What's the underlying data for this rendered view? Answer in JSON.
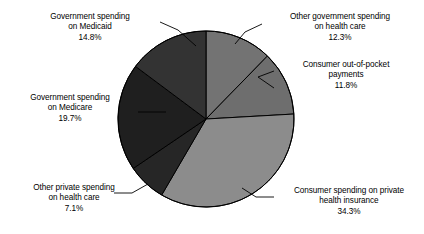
{
  "chart_data": {
    "type": "pie",
    "title": "",
    "subtitle": "",
    "xlabel": "",
    "ylabel": "",
    "legend_position": "none",
    "grid": false,
    "units": "percent",
    "start_angle_deg": 0,
    "direction": "clockwise",
    "center": {
      "x": 206,
      "y": 119
    },
    "radius": 88,
    "categories": [
      "Other government spending on health care",
      "Consumer out-of-pocket payments",
      "Consumer spending on private health insurance",
      "Other private spending on health care",
      "Government spending on Medicare",
      "Government spending on Medicaid"
    ],
    "values": [
      12.3,
      11.8,
      34.3,
      7.1,
      19.7,
      14.8
    ],
    "slices": [
      {
        "id": "other-government-spending",
        "line1": "Other government spending",
        "line2": "on health care",
        "value_label": "12.3%",
        "value": 12.3,
        "color": "#737373",
        "start_deg": 0,
        "end_deg": 44.28
      },
      {
        "id": "consumer-out-of-pocket",
        "line1": "Consumer out-of-pocket",
        "line2": "payments",
        "value_label": "11.8%",
        "value": 11.8,
        "color": "#6e6e6e",
        "start_deg": 44.28,
        "end_deg": 86.76
      },
      {
        "id": "consumer-private-insurance",
        "line1": "Consumer spending on private",
        "line2": "health insurance",
        "value_label": "34.3%",
        "value": 34.3,
        "color": "#8c8c8c",
        "start_deg": 86.76,
        "end_deg": 210.24
      },
      {
        "id": "other-private-spending",
        "line1": "Other private spending",
        "line2": "on health care",
        "value_label": "7.1%",
        "value": 7.1,
        "color": "#262626",
        "start_deg": 210.24,
        "end_deg": 235.8
      },
      {
        "id": "government-spending-medicare",
        "line1": "Government spending",
        "line2": "on Medicare",
        "value_label": "19.7%",
        "value": 19.7,
        "color": "#1f1f1f",
        "start_deg": 235.8,
        "end_deg": 306.72
      },
      {
        "id": "government-spending-medicaid",
        "line1": "Government spending",
        "line2": "on Medicaid",
        "value_label": "14.8%",
        "value": 14.8,
        "color": "#333333",
        "start_deg": 306.72,
        "end_deg": 360
      }
    ],
    "colors": {
      "background": "#ffffff",
      "outline": "#000000",
      "text": "#000000",
      "leader_line": "#000000"
    }
  }
}
